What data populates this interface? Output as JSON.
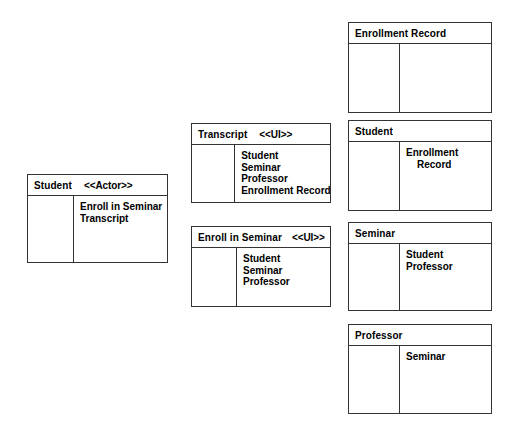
{
  "diagram": {
    "background_color": "#ffffff",
    "border_color": "#333333",
    "text_color": "#000000"
  },
  "cards": [
    {
      "id": "enrollment-record",
      "name": "Enrollment Record",
      "stereotype": "",
      "responsibilities": [],
      "collaborators": []
    },
    {
      "id": "student-entity",
      "name": "Student",
      "stereotype": "",
      "responsibilities": [],
      "collaborators": [
        "Enrollment",
        "Record"
      ]
    },
    {
      "id": "seminar-entity",
      "name": "Seminar",
      "stereotype": "",
      "responsibilities": [],
      "collaborators": [
        "Student",
        "Professor"
      ]
    },
    {
      "id": "professor-entity",
      "name": "Professor",
      "stereotype": "",
      "responsibilities": [],
      "collaborators": [
        "Seminar"
      ]
    },
    {
      "id": "transcript-ui",
      "name": "Transcript",
      "stereotype": "<<UI>>",
      "responsibilities": [],
      "collaborators": [
        "Student",
        "Seminar",
        "Professor",
        "Enrollment Record"
      ]
    },
    {
      "id": "enroll-in-seminar-ui",
      "name": "Enroll in Seminar",
      "stereotype": "<<UI>>",
      "responsibilities": [],
      "collaborators": [
        "Student",
        "Seminar",
        "Professor"
      ]
    },
    {
      "id": "student-actor",
      "name": "Student",
      "stereotype": "<<Actor>>",
      "responsibilities": [],
      "collaborators": [
        "Enroll in Seminar",
        "Transcript"
      ]
    }
  ]
}
